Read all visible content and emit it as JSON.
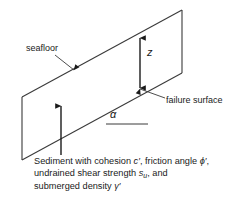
{
  "figure": {
    "type": "submarine-infinite-slope-diagram",
    "background_color": "#ffffff",
    "line_color": "#3a3a3a",
    "text_color": "#1a1a1a"
  },
  "labels": {
    "seafloor": "seafloor",
    "failure_surface": "failure surface",
    "depth_symbol": "z",
    "slope_angle_symbol": "α"
  },
  "caption": {
    "line1_pre": "Sediment with cohesion ",
    "line1_sym1": "c′",
    "line1_mid": ", friction angle ",
    "line1_sym2": "ϕ′",
    "line1_post": ",",
    "line2_pre": "undrained shear strength ",
    "line2_sym": "s",
    "line2_sub": "u",
    "line2_post": ", and",
    "line3_pre": "submerged density ",
    "line3_sym": "γ′"
  },
  "geometry": {
    "slab_top_left": [
      22,
      97
    ],
    "slab_top_right": [
      182,
      10
    ],
    "slab_bottom_right": [
      182,
      73
    ],
    "slab_bottom_left": [
      22,
      160
    ],
    "depth_arrow_x": 140,
    "depth_arrow_top_y": 36,
    "depth_arrow_bottom_y": 90,
    "vertical_arrow_x": 61,
    "vertical_arrow_top_y": 104,
    "vertical_arrow_bottom_y": 155,
    "angle_baseline_start": [
      106,
      124
    ],
    "angle_baseline_end": [
      148,
      124
    ]
  }
}
